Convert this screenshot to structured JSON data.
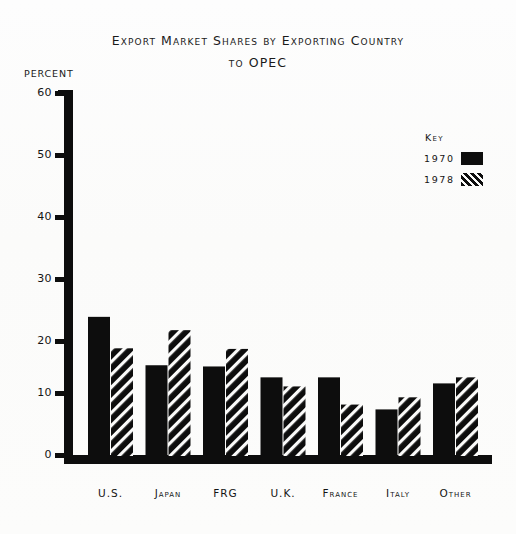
{
  "title": {
    "line1": "Export Market Shares by Exporting Country",
    "line2": "to OPEC"
  },
  "axis": {
    "y_title": "PERCENT",
    "y_ticks": [
      "60",
      "50",
      "40",
      "30",
      "20",
      "10",
      "0"
    ]
  },
  "legend": {
    "title": "Key",
    "items": [
      {
        "label": "1970",
        "pattern": "solid"
      },
      {
        "label": "1978",
        "pattern": "hatch"
      }
    ]
  },
  "colors": {
    "ink": "#0d0d0d",
    "paper": "#fbfbfa"
  },
  "chart_data": {
    "type": "bar",
    "title": "Export Market Shares by Exporting Country to OPEC",
    "xlabel": "",
    "ylabel": "PERCENT",
    "ylim": [
      0,
      60
    ],
    "yticks": [
      0,
      10,
      20,
      30,
      40,
      50,
      60
    ],
    "grid": false,
    "legend_position": "top-right",
    "categories": [
      "U.S.",
      "Japan",
      "FRG",
      "U.K.",
      "France",
      "Italy",
      "Other"
    ],
    "series": [
      {
        "name": "1970",
        "values": [
          23.0,
          15.0,
          14.8,
          13.0,
          13.0,
          7.7,
          12.0
        ]
      },
      {
        "name": "1978",
        "values": [
          17.8,
          20.8,
          17.7,
          11.5,
          8.5,
          9.7,
          13.0
        ]
      }
    ]
  }
}
